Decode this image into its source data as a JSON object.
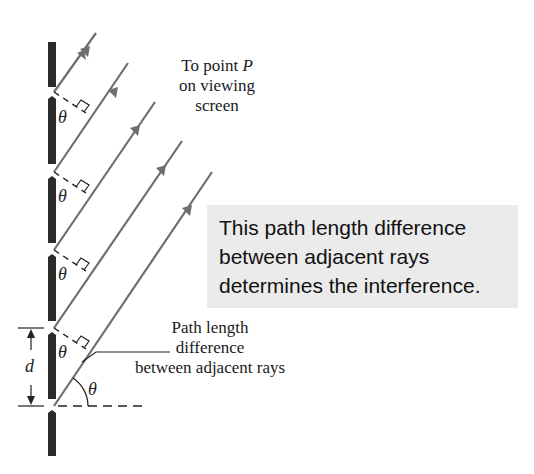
{
  "diagram": {
    "type": "multi-slit diffraction geometry",
    "colors": {
      "wall": "#2b2b2b",
      "ray": "#6e6e6e",
      "callout_bg": "#ebebeb",
      "text": "#1a1a1a"
    },
    "slits_y": [
      92,
      172,
      250,
      328,
      406
    ],
    "ray_count": 5,
    "labels": {
      "top": {
        "line1_prefix": "To point ",
        "line1_symbol": "P",
        "line2": "on viewing",
        "line3": "screen"
      },
      "callout": {
        "line1": "This path length difference",
        "line2": "between adjacent rays",
        "line3": "determines the interference."
      },
      "bottom": {
        "line1": "Path length",
        "line2": "difference",
        "line3": "between adjacent rays"
      },
      "symbols": {
        "theta": "θ",
        "spacing": "d"
      }
    }
  }
}
